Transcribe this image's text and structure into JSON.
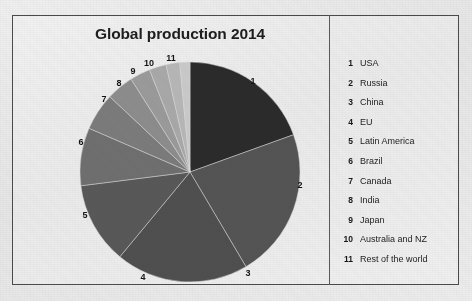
{
  "chart_data": {
    "type": "pie",
    "title": "Global production 2014",
    "xlabel": "",
    "ylabel": "",
    "legend_position": "right",
    "grid": false,
    "categories": [
      "USA",
      "Russia",
      "China",
      "EU",
      "Latin America",
      "Brazil",
      "Canada",
      "India",
      "Japan",
      "Australia and NZ",
      "Rest of the world"
    ],
    "keys": [
      "1",
      "2",
      "3",
      "4",
      "5",
      "6",
      "7",
      "8",
      "9",
      "10",
      "11"
    ],
    "values": [
      19.5,
      22.0,
      19.5,
      12.0,
      8.5,
      5.5,
      4.0,
      3.0,
      2.5,
      2.0,
      1.5
    ],
    "unit": "percent",
    "slice_colors": [
      "#2b2b2b",
      "#545454",
      "#4f4f4f",
      "#585858",
      "#6f6f6f",
      "#7b7b7b",
      "#8c8c8c",
      "#9a9a9a",
      "#a8a8a8",
      "#b6b6b6",
      "#c9c9c9"
    ],
    "slice_labels": [
      {
        "key": "1",
        "x": 253,
        "y": 81
      },
      {
        "key": "2",
        "x": 300,
        "y": 185
      },
      {
        "key": "3",
        "x": 248,
        "y": 273
      },
      {
        "key": "4",
        "x": 143,
        "y": 277
      },
      {
        "key": "5",
        "x": 85,
        "y": 215
      },
      {
        "key": "6",
        "x": 81,
        "y": 142
      },
      {
        "key": "7",
        "x": 104,
        "y": 99
      },
      {
        "key": "8",
        "x": 119,
        "y": 83
      },
      {
        "key": "9",
        "x": 133,
        "y": 71
      },
      {
        "key": "10",
        "x": 149,
        "y": 63
      },
      {
        "key": "11",
        "x": 171,
        "y": 58
      }
    ]
  },
  "frame": {
    "title": "Global production 2014"
  },
  "legend": {
    "rows": [
      {
        "num": "1",
        "name": "USA"
      },
      {
        "num": "2",
        "name": "Russia"
      },
      {
        "num": "3",
        "name": "China"
      },
      {
        "num": "4",
        "name": "EU"
      },
      {
        "num": "5",
        "name": "Latin America"
      },
      {
        "num": "6",
        "name": "Brazil"
      },
      {
        "num": "7",
        "name": "Canada"
      },
      {
        "num": "8",
        "name": "India"
      },
      {
        "num": "9",
        "name": "Japan"
      },
      {
        "num": "10",
        "name": "Australia and NZ"
      },
      {
        "num": "11",
        "name": "Rest of the world"
      }
    ]
  },
  "colors": {
    "paper": "#ebebeb",
    "ink": "#1d1d1d",
    "frame_border": "#4a4a4a"
  }
}
